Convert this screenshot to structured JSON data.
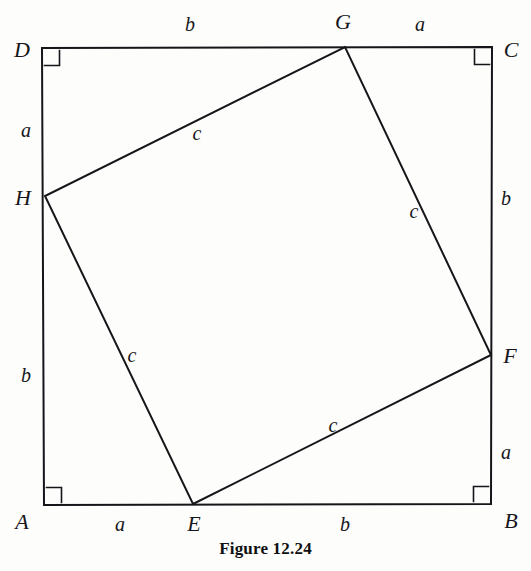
{
  "figure": {
    "caption": "Figure 12.24",
    "caption_x": 265,
    "caption_y": 549,
    "stroke_color": "#16161a",
    "background_color": "#fdfdfb",
    "stroke_width": 2.0,
    "width": 531,
    "height": 571
  },
  "chart_data": {
    "type": "diagram",
    "title": "Figure 12.24",
    "outer_square": {
      "name": "ABCD",
      "vertices": [
        {
          "label": "A",
          "x": 44,
          "y": 505
        },
        {
          "label": "B",
          "x": 491,
          "y": 504
        },
        {
          "label": "C",
          "x": 492,
          "y": 47
        },
        {
          "label": "D",
          "x": 42,
          "y": 48
        }
      ],
      "right_angle_marks": [
        "A",
        "B",
        "C",
        "D"
      ]
    },
    "inner_square": {
      "name": "EFGH",
      "vertices": [
        {
          "label": "E",
          "x": 193,
          "y": 504
        },
        {
          "label": "F",
          "x": 491,
          "y": 355
        },
        {
          "label": "G",
          "x": 345,
          "y": 47
        },
        {
          "label": "H",
          "x": 45,
          "y": 196
        }
      ]
    },
    "segments": [
      {
        "label": "a",
        "from": "A",
        "to": "E",
        "side": "bottom"
      },
      {
        "label": "b",
        "from": "E",
        "to": "B",
        "side": "bottom"
      },
      {
        "label": "a",
        "from": "B",
        "to": "F",
        "side": "right"
      },
      {
        "label": "b",
        "from": "F",
        "to": "C",
        "side": "right"
      },
      {
        "label": "a",
        "from": "C",
        "to": "G",
        "side": "top"
      },
      {
        "label": "b",
        "from": "G",
        "to": "D",
        "side": "top"
      },
      {
        "label": "a",
        "from": "D",
        "to": "H",
        "side": "left"
      },
      {
        "label": "b",
        "from": "H",
        "to": "A",
        "side": "left"
      },
      {
        "label": "c",
        "from": "H",
        "to": "G",
        "side": "inner"
      },
      {
        "label": "c",
        "from": "G",
        "to": "F",
        "side": "inner"
      },
      {
        "label": "c",
        "from": "E",
        "to": "F",
        "side": "inner"
      },
      {
        "label": "c",
        "from": "H",
        "to": "E",
        "side": "inner"
      }
    ]
  },
  "vertex_labels": [
    {
      "name": "vertex-label-d",
      "text": "D",
      "x": 22,
      "y": 50
    },
    {
      "name": "vertex-label-c",
      "text": "C",
      "x": 511,
      "y": 50
    },
    {
      "name": "vertex-label-g",
      "text": "G",
      "x": 343,
      "y": 22
    },
    {
      "name": "vertex-label-h",
      "text": "H",
      "x": 23,
      "y": 198
    },
    {
      "name": "vertex-label-f",
      "text": "F",
      "x": 510,
      "y": 356
    },
    {
      "name": "vertex-label-a",
      "text": "A",
      "x": 22,
      "y": 522
    },
    {
      "name": "vertex-label-e",
      "text": "E",
      "x": 194,
      "y": 524
    },
    {
      "name": "vertex-label-b",
      "text": "B",
      "x": 511,
      "y": 521
    }
  ],
  "side_labels": [
    {
      "name": "side-label-top-b",
      "text": "b",
      "x": 190,
      "y": 24
    },
    {
      "name": "side-label-top-a",
      "text": "a",
      "x": 420,
      "y": 24
    },
    {
      "name": "side-label-left-a",
      "text": "a",
      "x": 26,
      "y": 130
    },
    {
      "name": "side-label-left-b",
      "text": "b",
      "x": 26,
      "y": 375
    },
    {
      "name": "side-label-right-b",
      "text": "b",
      "x": 506,
      "y": 198
    },
    {
      "name": "side-label-right-a",
      "text": "a",
      "x": 506,
      "y": 452
    },
    {
      "name": "side-label-bottom-a",
      "text": "a",
      "x": 120,
      "y": 524
    },
    {
      "name": "side-label-bottom-b",
      "text": "b",
      "x": 345,
      "y": 524
    },
    {
      "name": "side-label-inner-hg",
      "text": "c",
      "x": 197,
      "y": 133
    },
    {
      "name": "side-label-inner-gf",
      "text": "c",
      "x": 414,
      "y": 211
    },
    {
      "name": "side-label-inner-he",
      "text": "c",
      "x": 132,
      "y": 355
    },
    {
      "name": "side-label-inner-ef",
      "text": "c",
      "x": 333,
      "y": 425
    }
  ]
}
